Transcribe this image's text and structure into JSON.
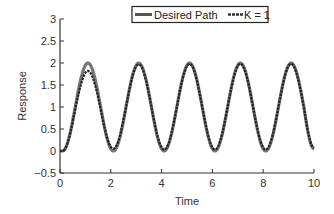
{
  "chart_data": {
    "type": "line",
    "title": "",
    "xlabel": "Time",
    "ylabel": "Response",
    "xlim": [
      0,
      10
    ],
    "ylim": [
      -0.5,
      3
    ],
    "xticks": [
      0,
      2,
      4,
      6,
      8,
      10
    ],
    "xtick_labels": [
      "0",
      "2",
      "4",
      "6",
      "8",
      "10"
    ],
    "yticks": [
      -0.5,
      0,
      0.5,
      1,
      1.5,
      2,
      2.5,
      3
    ],
    "ytick_labels": [
      "−0.5",
      "0",
      "0.5",
      "1",
      "1.5",
      "2",
      "2.5",
      "3"
    ],
    "grid": false,
    "legend_position": "top-center",
    "series": [
      {
        "name": "Desired Path",
        "style": "solid",
        "color": "#777777",
        "x": [
          0,
          0.1,
          0.6,
          1.1,
          1.6,
          2.1,
          2.6,
          3.1,
          3.6,
          4.1,
          4.6,
          5.1,
          5.6,
          6.1,
          6.6,
          7.1,
          7.6,
          8.1,
          8.6,
          9.1,
          9.6,
          10
        ],
        "values": [
          0,
          0,
          1,
          2,
          1,
          0,
          1,
          2,
          1,
          0,
          1,
          2,
          1,
          0,
          1,
          2,
          1,
          0,
          1,
          2,
          1,
          0.05
        ]
      },
      {
        "name": "K = 1",
        "style": "dashed",
        "color": "#222222",
        "x": [
          0,
          0.1,
          0.6,
          1.1,
          1.6,
          2.1,
          2.6,
          3.1,
          3.6,
          4.1,
          4.6,
          5.1,
          5.6,
          6.1,
          6.6,
          7.1,
          7.6,
          8.1,
          8.6,
          9.1,
          9.6,
          10
        ],
        "values": [
          0,
          0,
          0.95,
          1.82,
          0.95,
          0.05,
          1,
          1.97,
          1,
          0.03,
          1,
          1.98,
          1,
          0.03,
          1,
          1.98,
          1,
          0.03,
          1,
          1.98,
          1,
          0.07
        ]
      }
    ]
  },
  "legend": {
    "items": [
      {
        "label": "Desired Path"
      },
      {
        "label": "K = 1"
      }
    ]
  },
  "colors": {
    "axis": "#333333",
    "desired": "#777777",
    "k1": "#222222"
  }
}
